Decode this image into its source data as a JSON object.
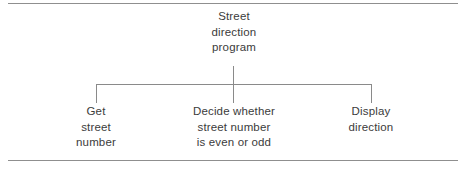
{
  "figure": {
    "type": "hierarchy-diagram",
    "root": {
      "lines": [
        "Street",
        "direction",
        "program"
      ]
    },
    "children": [
      {
        "lines": [
          "Get",
          "street",
          "number"
        ]
      },
      {
        "lines": [
          "Decide whether",
          "street number",
          "is even or odd"
        ]
      },
      {
        "lines": [
          "Display",
          "direction"
        ]
      }
    ],
    "colors": {
      "text": "#3b3b3b",
      "connector": "#8a8a8a",
      "rule": "#8f8f8f",
      "background": "#ffffff"
    }
  }
}
